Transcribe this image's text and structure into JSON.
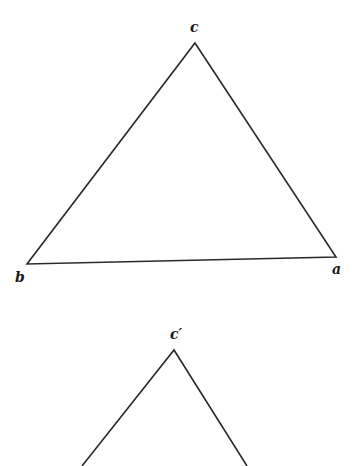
{
  "figures": [
    {
      "name": "triangle-abc",
      "vertices": {
        "a": {
          "label": "a",
          "x": 336,
          "y": 257
        },
        "b": {
          "label": "b",
          "x": 27,
          "y": 264
        },
        "c": {
          "label": "c",
          "x": 195,
          "y": 43
        }
      },
      "labels": {
        "a": "a",
        "b": "b",
        "c": "c"
      }
    },
    {
      "name": "triangle-prime-partial",
      "vertices": {
        "c_prime": {
          "label": "c′",
          "x": 174,
          "y": 350
        },
        "left_end": {
          "x": 82,
          "y": 466
        },
        "right_end": {
          "x": 247,
          "y": 466
        }
      },
      "labels": {
        "c_prime": "c′"
      }
    }
  ],
  "style": {
    "stroke_color": "#2a2a2a",
    "stroke_width": 1.6
  }
}
